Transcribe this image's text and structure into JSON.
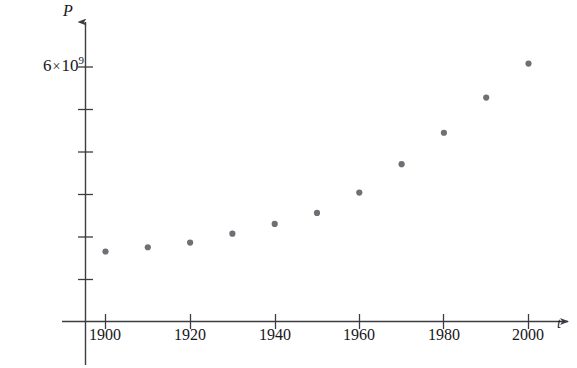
{
  "chart_data": {
    "type": "scatter",
    "title": "",
    "xlabel": "t",
    "ylabel": "P",
    "x": [
      1900,
      1910,
      1920,
      1930,
      1940,
      1950,
      1960,
      1970,
      1980,
      1990,
      2000
    ],
    "values": [
      1.65,
      1.75,
      1.86,
      2.07,
      2.3,
      2.56,
      3.04,
      3.71,
      4.45,
      5.28,
      6.08
    ],
    "y_unit": "people",
    "xticks": [
      1900,
      1920,
      1940,
      1960,
      1980,
      2000
    ],
    "xtick_labels": [
      "1900",
      "1920",
      "1940",
      "1960",
      "1980",
      "2000"
    ],
    "yticks": [
      1,
      2,
      3,
      4,
      5,
      6
    ],
    "ytick_labels": [
      "",
      "",
      "",
      "",
      "",
      "6 × 10⁹"
    ],
    "ylim": [
      0,
      7.2
    ],
    "xlim": [
      1893,
      2012
    ],
    "grid": false,
    "legend": null,
    "marker_color": "#6f6f76",
    "axis_color": "#3c3c42",
    "annotations": []
  },
  "labels": {
    "y_axis_name": "P",
    "x_axis_name": "t",
    "y_tick_top": {
      "coefficient": "6",
      "times": "×",
      "base": "10",
      "exponent": "9"
    },
    "x_tick_1900": "1900",
    "x_tick_1920": "1920",
    "x_tick_1940": "1940",
    "x_tick_1960": "1960",
    "x_tick_1980": "1980",
    "x_tick_2000": "2000"
  }
}
